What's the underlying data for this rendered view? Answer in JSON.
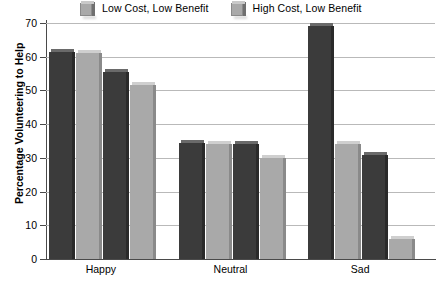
{
  "chart_data": {
    "type": "bar",
    "title": "",
    "subtitle": "",
    "xlabel": "",
    "ylabel": "Percentage Volunteering to Help",
    "categories": [
      "Happy",
      "Neutral",
      "Sad"
    ],
    "ylim": [
      0,
      70
    ],
    "yticks": [
      0,
      10,
      20,
      30,
      40,
      50,
      60,
      70
    ],
    "ytick_labels": [
      "0",
      "10",
      "20",
      "30",
      "40",
      "50",
      "60",
      "70"
    ],
    "grid": true,
    "legend_position": "top",
    "series": [
      {
        "name": "Low Cost, Low Benefit",
        "color": "#3b3b3b",
        "values": [
          61.5,
          34.5,
          69.0
        ]
      },
      {
        "name": "High Cost, Low Benefit",
        "color": "#a9a9a9",
        "values": [
          61.0,
          34.0,
          34.0
        ]
      },
      {
        "name": "",
        "color": "#3b3b3b",
        "values": [
          55.5,
          34.0,
          31.0
        ]
      },
      {
        "name": "",
        "color": "#a9a9a9",
        "values": [
          51.5,
          30.0,
          6.0
        ]
      }
    ],
    "legend": [
      {
        "label": "Low Cost, Low Benefit",
        "color": "#a9a9a9"
      },
      {
        "label": "High Cost, Low Benefit",
        "color": "#a9a9a9"
      }
    ]
  }
}
